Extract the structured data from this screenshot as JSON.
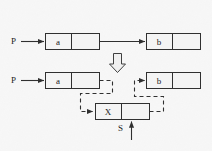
{
  "diagram": {
    "background_color": "#f7f7f7",
    "stroke_color": "#303030",
    "text_color": "#1b1b1b",
    "pointer_labels": {
      "p_top": "P",
      "p_bottom": "P",
      "s": "S"
    },
    "nodes": {
      "a_top": {
        "value": "a",
        "next_value": ""
      },
      "b_top": {
        "value": "b",
        "next_value": ""
      },
      "a_bottom": {
        "value": "a",
        "next_value": ""
      },
      "b_bottom": {
        "value": "b",
        "next_value": ""
      },
      "x_new": {
        "value": "X",
        "next_value": ""
      }
    },
    "transform_arrow": "down-arrow-outline",
    "edges": [
      {
        "name": "p-top-to-a",
        "style": "solid"
      },
      {
        "name": "a-top-to-b-top",
        "style": "solid"
      },
      {
        "name": "p-bottom-to-a",
        "style": "solid"
      },
      {
        "name": "a-bottom-to-x",
        "style": "dashed"
      },
      {
        "name": "x-to-b-bottom",
        "style": "dashed"
      },
      {
        "name": "s-to-x",
        "style": "solid"
      }
    ]
  }
}
